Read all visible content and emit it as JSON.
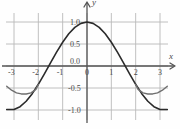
{
  "figure": {
    "background_color": "#fefefe",
    "grid_color": "#b9b9b9",
    "axis_color": "#555555",
    "curve_color_primary": "#2b2b2b",
    "curve_color_secondary": "#6f6f6f",
    "tick_label_color": "#4a4a4a",
    "axis_label_x": "x",
    "axis_label_y": "y"
  },
  "chart_data": {
    "type": "line",
    "title": "",
    "subtitle": "",
    "xlabel": "x",
    "ylabel": "y",
    "xlim": [
      -3.4,
      3.4
    ],
    "ylim": [
      -1.25,
      1.25
    ],
    "grid": true,
    "legend": false,
    "legend_position": "none",
    "xticks": [
      -3,
      -2,
      -1,
      0,
      1,
      2,
      3
    ],
    "xtick_labels": [
      "-3",
      "-2",
      "-1",
      "0",
      "1",
      "2",
      "3"
    ],
    "yticks": [
      -1.0,
      -0.5,
      0.0,
      0.5,
      1.0
    ],
    "ytick_labels": [
      "-1.0",
      "-0.5",
      "0.0",
      "0.5",
      "1.0"
    ],
    "x_gridlines": [
      -3,
      -2,
      -1,
      0,
      1,
      2,
      3
    ],
    "y_gridlines": [
      -1.0,
      -0.5,
      0.0,
      0.5,
      1.0
    ],
    "axes_arrows": {
      "x_positive": true,
      "y_positive": true
    },
    "series": [
      {
        "name": "cosine",
        "color": "#2b2b2b",
        "style": "solid",
        "width": 1.6,
        "x": [
          -3.3,
          -3.0,
          -2.75,
          -2.5,
          -2.25,
          -2.0,
          -1.75,
          -1.5,
          -1.25,
          -1.0,
          -0.75,
          -0.5,
          -0.25,
          0.0,
          0.25,
          0.5,
          0.75,
          1.0,
          1.25,
          1.5,
          1.75,
          2.0,
          2.25,
          2.5,
          2.75,
          3.0,
          3.3
        ],
        "y": [
          -0.987,
          -0.99,
          -0.924,
          -0.801,
          -0.628,
          -0.416,
          -0.178,
          0.071,
          0.315,
          0.54,
          0.732,
          0.878,
          0.969,
          1.0,
          0.969,
          0.878,
          0.732,
          0.54,
          0.315,
          0.071,
          -0.178,
          -0.416,
          -0.628,
          -0.801,
          -0.924,
          -0.99,
          -0.987
        ]
      },
      {
        "name": "secondary-branch",
        "color": "#6f6f6f",
        "style": "solid",
        "width": 1.4,
        "x": [
          -3.3,
          -3.1,
          -2.9,
          -2.7,
          -2.5,
          -2.3,
          -2.1,
          -2.0
        ],
        "y": [
          -0.46,
          -0.55,
          -0.61,
          -0.635,
          -0.637,
          -0.612,
          -0.53,
          -0.42
        ],
        "x_mirror": [
          2.0,
          2.1,
          2.3,
          2.5,
          2.7,
          2.9,
          3.1,
          3.3
        ],
        "y_mirror": [
          -0.42,
          -0.53,
          -0.612,
          -0.637,
          -0.635,
          -0.61,
          -0.55,
          -0.46
        ]
      }
    ]
  }
}
